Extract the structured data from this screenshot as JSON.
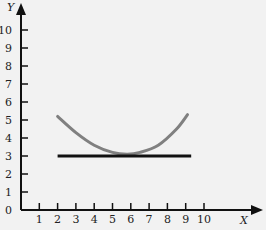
{
  "chart_data": {
    "type": "line",
    "title": "",
    "xlabel": "X",
    "ylabel": "Y",
    "xlim": [
      0,
      10.5
    ],
    "ylim": [
      0,
      10.5
    ],
    "grid": false,
    "legend": null,
    "x_ticks": [
      1,
      2,
      3,
      4,
      5,
      6,
      7,
      8,
      9,
      10
    ],
    "y_ticks": [
      0,
      1,
      2,
      3,
      4,
      5,
      6,
      7,
      8,
      9,
      10
    ],
    "series": [
      {
        "name": "curve",
        "style": "gray-curve",
        "color": "#808080",
        "x": [
          2,
          3,
          4,
          5,
          5.8,
          6.5,
          7.5,
          8.5,
          9.1
        ],
        "y": [
          5.2,
          4.3,
          3.6,
          3.2,
          3.1,
          3.2,
          3.6,
          4.5,
          5.3
        ]
      },
      {
        "name": "horizontal-line",
        "style": "black-line",
        "color": "#111111",
        "x": [
          2,
          9.3
        ],
        "y": [
          3,
          3
        ]
      }
    ]
  }
}
